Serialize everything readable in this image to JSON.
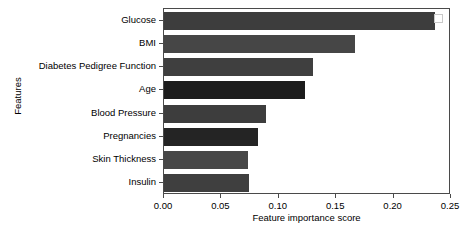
{
  "chart_data": {
    "type": "bar",
    "orientation": "horizontal",
    "title": "",
    "xlabel": "Feature importance score",
    "ylabel": "Features",
    "categories": [
      "Glucose",
      "BMI",
      "Diabetes Pedigree Function",
      "Age",
      "Blood Pressure",
      "Pregnancies",
      "Skin Thickness",
      "Insulin"
    ],
    "values": [
      0.236,
      0.166,
      0.13,
      0.123,
      0.089,
      0.082,
      0.073,
      0.074
    ],
    "bar_colors": [
      "#3d3d3d",
      "#464646",
      "#3f3f3f",
      "#1c1c1c",
      "#3d3d3d",
      "#242424",
      "#474747",
      "#3f3f3f"
    ],
    "xlim": [
      0.0,
      0.25
    ],
    "xticks": [
      0.0,
      0.05,
      0.1,
      0.15,
      0.2,
      0.25
    ],
    "xtick_labels": [
      "0.00",
      "0.05",
      "0.10",
      "0.15",
      "0.20",
      "0.25"
    ],
    "grid": false,
    "legend": "",
    "legend_position": "top-right"
  },
  "figure": {
    "background": "#ffffff",
    "frame_color": "#4a4a4a",
    "marker_name": "legend-swatch"
  }
}
